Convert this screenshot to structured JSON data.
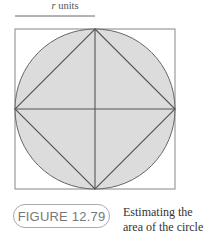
{
  "diagram": {
    "units_label": {
      "var": "r",
      "suffix": " units"
    },
    "shapes": {
      "outer_square": "square circumscribing circle",
      "circle": "circle of radius r (shaded)",
      "inner_square": "square inscribed in circle (diamond)",
      "diameters": [
        "horizontal",
        "vertical"
      ]
    },
    "colors": {
      "fill": "#dcdcdc",
      "stroke": "#555555",
      "square_stroke": "#888888"
    }
  },
  "figure": {
    "label": "FIGURE 12.79",
    "caption_line1": "Estimating the",
    "caption_line2": "area of the circle"
  }
}
